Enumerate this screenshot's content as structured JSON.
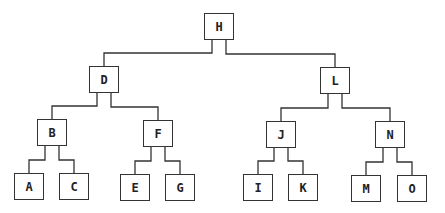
{
  "tree": {
    "root": "H",
    "nodes": [
      {
        "id": "H",
        "x": 204,
        "y": 13,
        "children": [
          "D",
          "L"
        ]
      },
      {
        "id": "D",
        "x": 89,
        "y": 66,
        "children": [
          "B",
          "F"
        ]
      },
      {
        "id": "L",
        "x": 320,
        "y": 67,
        "children": [
          "J",
          "N"
        ]
      },
      {
        "id": "B",
        "x": 37,
        "y": 119,
        "children": [
          "A",
          "C"
        ]
      },
      {
        "id": "F",
        "x": 143,
        "y": 120,
        "children": [
          "E",
          "G"
        ]
      },
      {
        "id": "J",
        "x": 266,
        "y": 121,
        "children": [
          "I",
          "K"
        ]
      },
      {
        "id": "N",
        "x": 375,
        "y": 121,
        "children": [
          "M",
          "O"
        ]
      },
      {
        "id": "A",
        "x": 14,
        "y": 173,
        "children": []
      },
      {
        "id": "C",
        "x": 59,
        "y": 173,
        "children": []
      },
      {
        "id": "E",
        "x": 120,
        "y": 174,
        "children": []
      },
      {
        "id": "G",
        "x": 165,
        "y": 174,
        "children": []
      },
      {
        "id": "I",
        "x": 243,
        "y": 174,
        "children": []
      },
      {
        "id": "K",
        "x": 288,
        "y": 174,
        "children": []
      },
      {
        "id": "M",
        "x": 351,
        "y": 175,
        "children": []
      },
      {
        "id": "O",
        "x": 397,
        "y": 175,
        "children": []
      }
    ]
  },
  "labels": {
    "H": "H",
    "D": "D",
    "L": "L",
    "B": "B",
    "F": "F",
    "J": "J",
    "N": "N",
    "A": "A",
    "C": "C",
    "E": "E",
    "G": "G",
    "I": "I",
    "K": "K",
    "M": "M",
    "O": "O"
  }
}
